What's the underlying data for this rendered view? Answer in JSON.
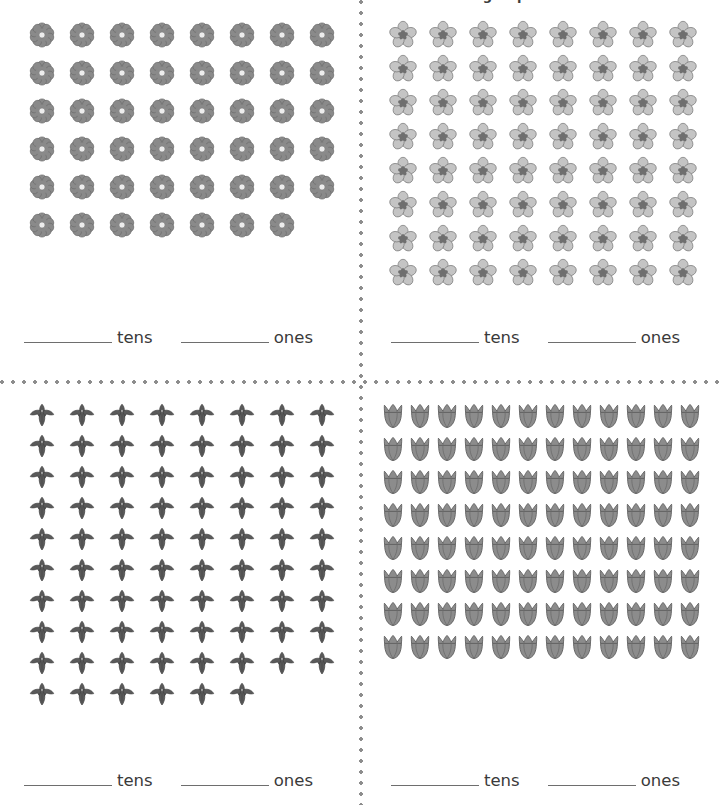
{
  "title": "Count the flowers. Write the number of tens and ones in each group.",
  "labels": {
    "tens": "tens",
    "ones": "ones"
  },
  "colors": {
    "daisy_petal": "#8a8a8a",
    "daisy_center": "#ededed",
    "five_petal_petal": "#c4c4c4",
    "five_petal_center": "#6f6f6f",
    "iris": "#5a5a5a",
    "tulip": "#8c8c8c",
    "line": "#6e6e6e",
    "dot_divider": "#8d8d8d",
    "text": "#3a3a3a",
    "background": "#ffffff"
  },
  "quadrants": [
    {
      "id": "q1",
      "position": "top-left",
      "flower_type": "daisy",
      "flower_icon_name": "daisy-flower-icon",
      "rows": [
        8,
        8,
        8,
        8,
        8,
        7
      ],
      "columns": 8,
      "total": 47,
      "tens": 4,
      "ones": 7,
      "tens_answer": "",
      "ones_answer": ""
    },
    {
      "id": "q2",
      "position": "top-right",
      "flower_type": "five-petal-blossom",
      "flower_icon_name": "five-petal-flower-icon",
      "rows": [
        8,
        8,
        8,
        8,
        8,
        8,
        8,
        8
      ],
      "columns": 8,
      "total": 64,
      "tens": 6,
      "ones": 4,
      "tens_answer": "",
      "ones_answer": ""
    },
    {
      "id": "q3",
      "position": "bottom-left",
      "flower_type": "iris",
      "flower_icon_name": "iris-flower-icon",
      "rows": [
        8,
        8,
        8,
        8,
        8,
        8,
        8,
        8,
        8,
        6
      ],
      "columns": 8,
      "total": 78,
      "tens": 7,
      "ones": 8,
      "tens_answer": "",
      "ones_answer": ""
    },
    {
      "id": "q4",
      "position": "bottom-right",
      "flower_type": "tulip",
      "flower_icon_name": "tulip-flower-icon",
      "rows": [
        12,
        12,
        12,
        12,
        12,
        12,
        12,
        12
      ],
      "columns": 12,
      "total": 96,
      "tens": 9,
      "ones": 6,
      "tens_answer": "",
      "ones_answer": ""
    }
  ]
}
